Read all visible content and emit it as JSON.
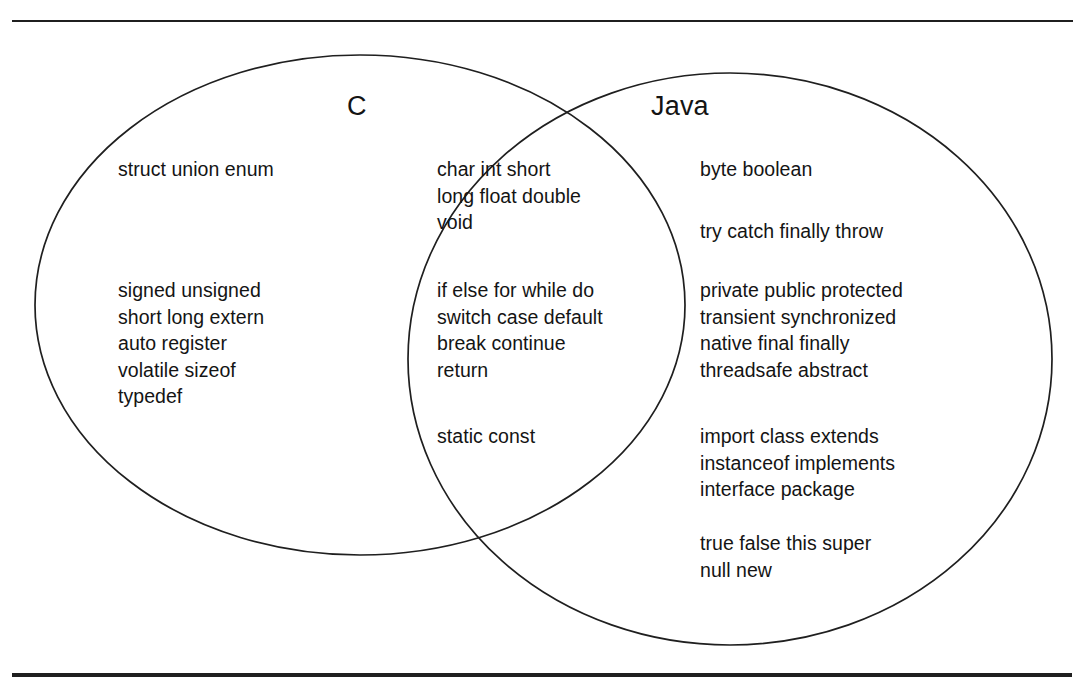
{
  "figure": {
    "kind": "venn-diagram",
    "caption_rule_top": "horizontal-rule",
    "caption_rule_bottom": "horizontal-rule",
    "stroke_color": "#1f1f1f",
    "background_color": "#ffffff",
    "text_color": "#141414"
  },
  "sets": {
    "left": {
      "title": "C",
      "blocks": [
        {
          "name": "c-user-types",
          "lines": [
            "struct union enum"
          ]
        },
        {
          "name": "c-storage-and-modifiers",
          "lines": [
            "signed unsigned",
            "short long extern",
            "auto register",
            "volatile sizeof",
            "typedef"
          ]
        }
      ]
    },
    "intersection": {
      "title": "",
      "blocks": [
        {
          "name": "shared-primitive-types",
          "lines": [
            "char int short",
            "long float double",
            "void"
          ]
        },
        {
          "name": "shared-control-flow",
          "lines": [
            "if else for while do",
            "switch case default",
            "break continue",
            "return"
          ]
        },
        {
          "name": "shared-modifiers",
          "lines": [
            "static const"
          ]
        }
      ]
    },
    "right": {
      "title": "Java",
      "blocks": [
        {
          "name": "java-primitive-types",
          "lines": [
            "byte boolean"
          ]
        },
        {
          "name": "java-exceptions",
          "lines": [
            "try catch finally throw"
          ]
        },
        {
          "name": "java-modifiers",
          "lines": [
            "private public protected",
            "transient synchronized",
            "native final finally",
            "threadsafe abstract"
          ]
        },
        {
          "name": "java-oop-keywords",
          "lines": [
            "import class extends",
            "instanceof implements",
            "interface package"
          ]
        },
        {
          "name": "java-literals",
          "lines": [
            "true false this super",
            "null new"
          ]
        }
      ]
    }
  },
  "geometry": {
    "left_ellipse": {
      "cx": 360,
      "cy": 305,
      "rx": 325,
      "ry": 250
    },
    "right_ellipse": {
      "cx": 730,
      "cy": 359,
      "rx": 322,
      "ry": 286
    }
  }
}
